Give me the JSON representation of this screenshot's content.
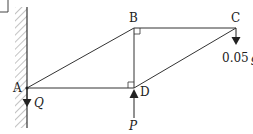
{
  "diagram": {
    "type": "truss-frame",
    "points": {
      "A": {
        "label": "A",
        "x": 27,
        "y": 88
      },
      "B": {
        "label": "B",
        "x": 134,
        "y": 28
      },
      "C": {
        "label": "C",
        "x": 236,
        "y": 28
      },
      "D": {
        "label": "D",
        "x": 134,
        "y": 88
      }
    },
    "members": [
      "AB",
      "BC",
      "BD",
      "AD",
      "DC"
    ],
    "right_angles": [
      "B",
      "D"
    ],
    "forces": {
      "Q": {
        "label": "Q",
        "at": "A",
        "direction": "down"
      },
      "P": {
        "label": "P",
        "at": "D",
        "direction": "up"
      },
      "load": {
        "label_num": "0.05",
        "label_var": "g",
        "at": "C",
        "direction": "down"
      }
    },
    "support": "hatched vertical wall at A",
    "colors": {
      "line": "#333333",
      "hatch": "#888888",
      "text": "#222222"
    }
  }
}
